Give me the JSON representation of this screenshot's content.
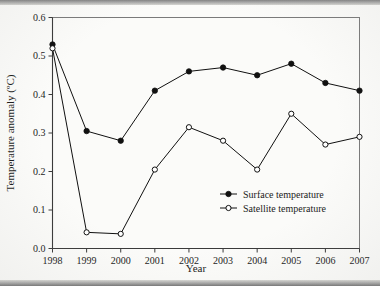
{
  "chart_data": {
    "type": "line",
    "title": "",
    "xlabel": "Year",
    "ylabel": "Temperature anomaly (ºC)",
    "x": [
      1998,
      1999,
      2000,
      2001,
      2002,
      2003,
      2004,
      2005,
      2006,
      2007
    ],
    "categories": [
      "1998",
      "1999",
      "2000",
      "2001",
      "2002",
      "2003",
      "2004",
      "2005",
      "2006",
      "2007"
    ],
    "xlim": [
      1998,
      2007
    ],
    "ylim": [
      0.0,
      0.6
    ],
    "ytick_labels": [
      "0.0",
      "0.1",
      "0.2",
      "0.3",
      "0.4",
      "0.5",
      "0.6"
    ],
    "ytick_values": [
      0.0,
      0.1,
      0.2,
      0.3,
      0.4,
      0.5,
      0.6
    ],
    "grid": false,
    "legend_position": "inside-lower-right",
    "series": [
      {
        "name": "Surface temperature",
        "marker": "filled-circle",
        "color": "#101010",
        "values": [
          0.53,
          0.305,
          0.28,
          0.41,
          0.46,
          0.47,
          0.45,
          0.48,
          0.43,
          0.41
        ]
      },
      {
        "name": "Satellite temperature",
        "marker": "open-circle",
        "color": "#101010",
        "values": [
          0.52,
          0.042,
          0.038,
          0.205,
          0.315,
          0.28,
          0.205,
          0.35,
          0.27,
          0.29
        ]
      }
    ]
  },
  "legend": {
    "items": [
      {
        "label": "Surface temperature",
        "marker": "filled-circle"
      },
      {
        "label": "Satellite temperature",
        "marker": "open-circle"
      }
    ]
  }
}
